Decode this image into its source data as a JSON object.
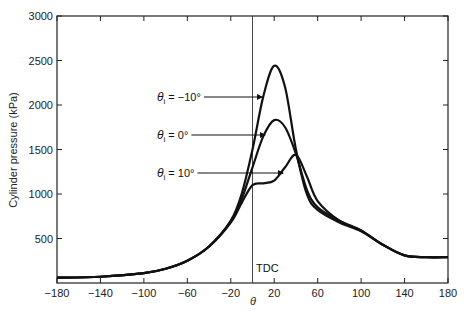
{
  "chart_data": {
    "type": "line",
    "title": "",
    "xlabel": "θ",
    "ylabel": "Cylinder pressure (kPa)",
    "xlim": [
      -180,
      180
    ],
    "ylim": [
      0,
      3000
    ],
    "xticks": [
      -180,
      -140,
      -100,
      -60,
      -20,
      20,
      60,
      100,
      140,
      180
    ],
    "yticks": [
      500,
      1000,
      1500,
      2000,
      2500,
      3000
    ],
    "grid": false,
    "vertical_marker": {
      "x": 0,
      "label": "TDC"
    },
    "series": [
      {
        "name": "θi = −10°",
        "x": [
          -180,
          -140,
          -100,
          -80,
          -60,
          -40,
          -20,
          -10,
          0,
          10,
          20,
          30,
          40,
          50,
          60,
          80,
          100,
          120,
          140,
          160,
          180
        ],
        "y": [
          60,
          70,
          110,
          160,
          250,
          410,
          700,
          1000,
          1500,
          2100,
          2440,
          2200,
          1500,
          1000,
          820,
          680,
          580,
          430,
          310,
          290,
          290
        ]
      },
      {
        "name": "θi = 0°",
        "x": [
          -180,
          -140,
          -100,
          -80,
          -60,
          -40,
          -20,
          -10,
          0,
          10,
          20,
          30,
          40,
          50,
          60,
          80,
          100,
          120,
          140,
          160,
          180
        ],
        "y": [
          60,
          70,
          110,
          160,
          250,
          410,
          690,
          940,
          1300,
          1650,
          1830,
          1750,
          1450,
          1050,
          850,
          700,
          590,
          430,
          310,
          290,
          290
        ]
      },
      {
        "name": "θi = 10°",
        "x": [
          -180,
          -140,
          -100,
          -80,
          -60,
          -40,
          -20,
          -10,
          0,
          10,
          20,
          30,
          40,
          50,
          60,
          80,
          100,
          120,
          140,
          160,
          180
        ],
        "y": [
          60,
          70,
          110,
          160,
          250,
          410,
          680,
          900,
          1100,
          1120,
          1150,
          1300,
          1440,
          1200,
          920,
          700,
          590,
          430,
          310,
          290,
          290
        ]
      }
    ],
    "annotations": [
      {
        "text_prefix": "θ",
        "subscript": "i",
        "text_suffix": " = −10°",
        "target_series": 0
      },
      {
        "text_prefix": "θ",
        "subscript": "i",
        "text_suffix": " = 0°",
        "target_series": 1
      },
      {
        "text_prefix": "θ",
        "subscript": "i",
        "text_suffix": " = 10°",
        "target_series": 2
      }
    ]
  }
}
